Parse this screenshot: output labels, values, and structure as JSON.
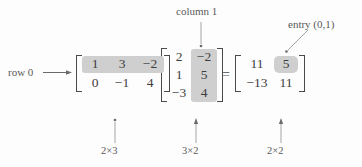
{
  "figure": {
    "background_color": "#fdfdfd",
    "text_color": "#4a4a4a",
    "highlight_color": "#cfcfcf"
  },
  "annotations": {
    "row_label": "row 0",
    "column_label": "column 1",
    "entry_label": "entry (0,1)"
  },
  "matrix_a": {
    "name": "left-matrix",
    "dimension_label": "2×3",
    "rows": [
      [
        "1",
        "3",
        "−2"
      ],
      [
        "0",
        "−1",
        "4"
      ]
    ],
    "highlight": "row 0"
  },
  "matrix_b": {
    "name": "right-matrix",
    "dimension_label": "3×2",
    "rows": [
      [
        "2",
        "−2"
      ],
      [
        "1",
        "5"
      ],
      [
        "−3",
        "4"
      ]
    ],
    "highlight": "column 1"
  },
  "equals_sign": "=",
  "matrix_c": {
    "name": "product-matrix",
    "dimension_label": "2×2",
    "rows": [
      [
        "11",
        "5"
      ],
      [
        "−13",
        "11"
      ]
    ],
    "highlight": "entry (0,1)"
  }
}
